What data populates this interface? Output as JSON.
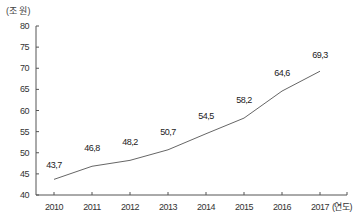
{
  "chart_data": {
    "type": "line",
    "title": "",
    "ylabel": "(조 원)",
    "xlabel": "(연도)",
    "ylim": [
      40,
      80
    ],
    "yticks": [
      40,
      45,
      50,
      55,
      60,
      65,
      70,
      75,
      80
    ],
    "categories": [
      "2010",
      "2011",
      "2012",
      "2013",
      "2014",
      "2015",
      "2016",
      "2017"
    ],
    "series": [
      {
        "name": "",
        "values": [
          43.7,
          46.8,
          48.2,
          50.7,
          54.5,
          58.2,
          64.6,
          69.3
        ],
        "labels": [
          "43,7",
          "46,8",
          "48,2",
          "50,7",
          "54,5",
          "58,2",
          "64,6",
          "69,3"
        ]
      }
    ],
    "grid": false,
    "legend": null,
    "colors": {
      "line": "#666666",
      "axis": "#555555"
    }
  }
}
